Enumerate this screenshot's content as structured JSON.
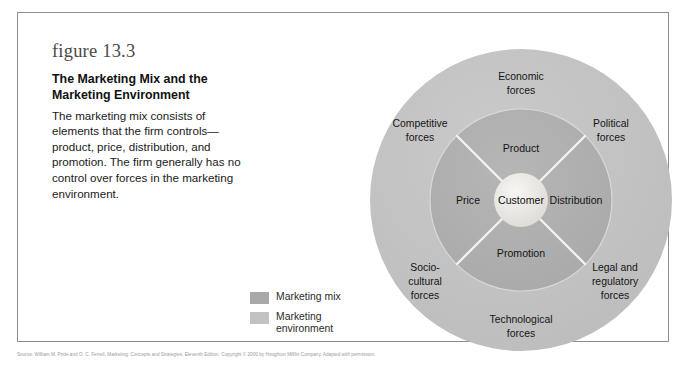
{
  "figure": {
    "number_label": "figure 13.3",
    "title_line_1": "The Marketing Mix and the",
    "title_line_2": "Marketing Environment",
    "description": "The marketing mix consists of elements that the firm controls—product, price, distribution, and promotion. The firm generally has no control over forces in the marketing environment."
  },
  "legend": {
    "items": [
      {
        "label": "Marketing mix",
        "color": "#a8a8a8"
      },
      {
        "label": "Marketing environment",
        "color": "#c2c2c2"
      }
    ]
  },
  "diagram": {
    "type": "concentric-circles",
    "core": {
      "label": "Customer",
      "color": "#ececec"
    },
    "marketing_mix": {
      "ring_color": "#b0b0b0",
      "elements": [
        {
          "label": "Product",
          "position": "top"
        },
        {
          "label": "Distribution",
          "position": "right"
        },
        {
          "label": "Promotion",
          "position": "bottom"
        },
        {
          "label": "Price",
          "position": "left"
        }
      ]
    },
    "marketing_environment": {
      "ring_color": "#c4c4c4",
      "forces": [
        {
          "line_1": "Economic",
          "line_2": "forces",
          "line_3": "",
          "position": "top"
        },
        {
          "line_1": "Political",
          "line_2": "forces",
          "line_3": "",
          "position": "upper-right"
        },
        {
          "line_1": "Legal and",
          "line_2": "regulatory",
          "line_3": "forces",
          "position": "lower-right"
        },
        {
          "line_1": "Technological",
          "line_2": "forces",
          "line_3": "",
          "position": "bottom"
        },
        {
          "line_1": "Socio-",
          "line_2": "cultural",
          "line_3": "forces",
          "position": "lower-left"
        },
        {
          "line_1": "Competitive",
          "line_2": "forces",
          "line_3": "",
          "position": "upper-left"
        }
      ]
    }
  },
  "source": {
    "text": "Source: William M. Pride and O. C. Ferrell, Marketing: Concepts and Strategies, Eleventh Edition. Copyright © 2000 by Houghton Mifflin Company. Adapted with permission."
  }
}
